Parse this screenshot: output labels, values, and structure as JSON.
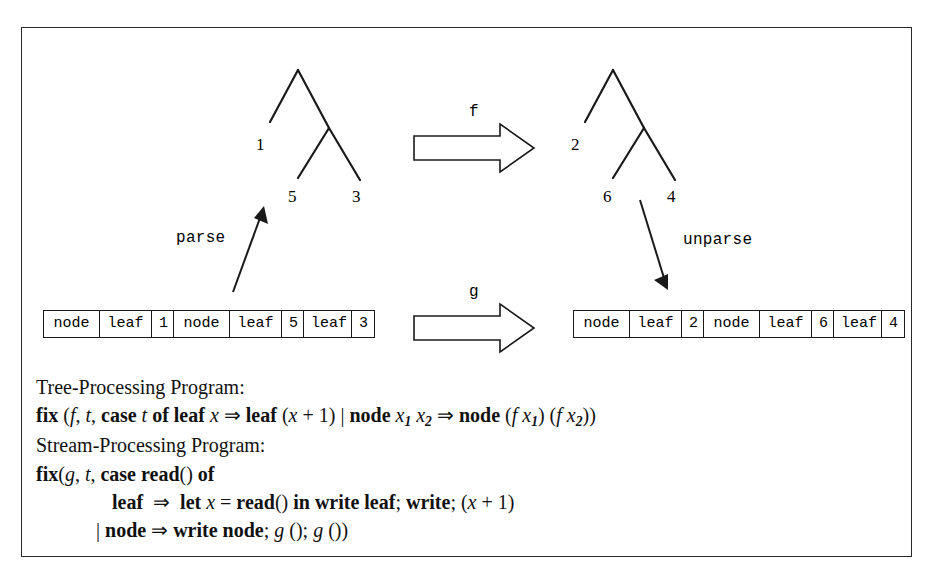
{
  "figure": {
    "diagram": {
      "left_tree": {
        "name": "input-tree",
        "leaf_labels": [
          "1",
          "5",
          "3"
        ]
      },
      "right_tree": {
        "name": "output-tree",
        "leaf_labels": [
          "2",
          "6",
          "4"
        ]
      },
      "arrows": {
        "tree_transform_label": "f",
        "stream_transform_label": "g",
        "parse_label": "parse",
        "unparse_label": "unparse"
      },
      "left_stream": {
        "name": "input-stream",
        "cells": [
          "node",
          "leaf",
          "1",
          "node",
          "leaf",
          "5",
          "leaf",
          "3"
        ]
      },
      "right_stream": {
        "name": "output-stream",
        "cells": [
          "node",
          "leaf",
          "2",
          "node",
          "leaf",
          "6",
          "leaf",
          "4"
        ]
      }
    },
    "programs": {
      "tree_heading": "Tree-Processing Program:",
      "tree_code_parts": {
        "p1": "fix ",
        "p2": "(",
        "p3": "f",
        "p4": ", ",
        "p5": "t",
        "p6": ", ",
        "p7": "case ",
        "p8": "t",
        "p9": " of ",
        "p10": "leaf ",
        "p11": "x",
        "p12": " ⇒ ",
        "p13": "leaf ",
        "p14": "(",
        "p15": "x",
        "p16": " + 1) | ",
        "p17": "node ",
        "p18": "x",
        "p19": "1",
        "p20": " ",
        "p21": "x",
        "p22": "2",
        "p23": " ⇒ ",
        "p24": "node ",
        "p25": "(",
        "p26": "f",
        "p27": " ",
        "p28": "x",
        "p29": "1",
        "p30": ") (",
        "p31": "f",
        "p32": " ",
        "p33": "x",
        "p34": "2",
        "p35": "))"
      },
      "tree_code_plain": "fix (f, t, case t of leaf x ⇒ leaf (x + 1) | node x1 x2 ⇒ node (f x1) (f x2))",
      "stream_heading": "Stream-Processing Program:",
      "stream_line1_parts": {
        "s1": "fix",
        "s2": "(",
        "s3": "g",
        "s4": ", ",
        "s5": "t",
        "s6": ", ",
        "s7": "case read",
        "s8": "() ",
        "s9": "of"
      },
      "stream_line1_plain": "fix(g, t, case read() of",
      "stream_line2_parts": {
        "s1": "leaf ",
        "s2": " ⇒ ",
        "s3": " let ",
        "s4": "x",
        "s5": " = ",
        "s6": "read",
        "s7": "() ",
        "s8": "in write leaf",
        "s9": "; ",
        "s10": "write",
        "s11": "; (",
        "s12": "x",
        "s13": " + 1)"
      },
      "stream_line2_plain": "leaf ⇒ let x = read() in write leaf; write; (x + 1)",
      "stream_line3_parts": {
        "s1": "| ",
        "s2": "node ",
        "s3": "⇒ ",
        "s4": "write node",
        "s5": "; ",
        "s6": "g",
        "s7": " (); ",
        "s8": "g",
        "s9": " ())"
      },
      "stream_line3_plain": "| node ⇒ write node; g (); g ())"
    },
    "colors": {
      "ink": "#111111",
      "frame": "#2a2a2a",
      "paper": "#ffffff"
    }
  }
}
